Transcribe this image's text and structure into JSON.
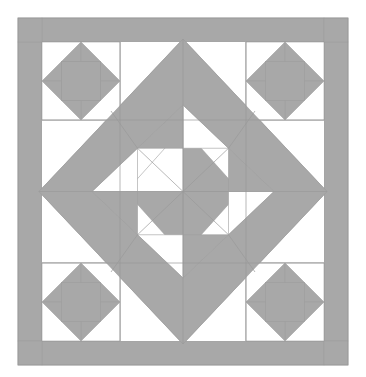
{
  "document": {
    "title": "Quilt Block Layout Diagram",
    "kind": "quilt-pattern-diagram",
    "canvas": {
      "width": 366,
      "height": 377
    },
    "background_color": "#ffffff"
  },
  "palette": {
    "background": "#ffffff",
    "fabric_light": "#ffffff",
    "fabric_medium_gray": "#a8a8a8",
    "seam_line": "#9a9a9a",
    "outer_margin": "#ffffff"
  },
  "layout": {
    "margin": {
      "left": 18,
      "top": 18,
      "right": 18,
      "bottom": 12
    },
    "border_width": 24,
    "block_left": 18,
    "block_top": 18,
    "block_right": 348,
    "block_bottom": 365,
    "inner_left": 42,
    "inner_top": 42,
    "inner_right": 324,
    "inner_bottom": 341,
    "grid_divisions": 4,
    "center_x": 183,
    "center_y": 191.5
  },
  "components": {
    "outer_border": {
      "name": "sashing-border",
      "color": "#a8a8a8",
      "width": 24,
      "corner_squares": 4
    },
    "center_medallion": {
      "name": "on-point-diamond-frame",
      "shape": "diamond",
      "color": "#a8a8a8",
      "outer_half_diagonal": 141,
      "inner_half_diagonal": 93
    },
    "corner_stars": {
      "name": "friendship-star-pinwheel",
      "count": 4,
      "size": 78,
      "positions": [
        "top-left",
        "top-right",
        "bottom-left",
        "bottom-right"
      ],
      "orientation": "identical",
      "center_square_color": "#a8a8a8",
      "blade_color": "#a8a8a8"
    },
    "center_pinwheel": {
      "name": "central-pinwheel",
      "color": "#a8a8a8",
      "half_size": 93
    }
  },
  "chart_data": {
    "type": "diagram",
    "symmetry": "4-fold rotational",
    "colors_used": [
      "#ffffff",
      "#a8a8a8"
    ],
    "element_counts": {
      "border_strips": 4,
      "border_corner_squares": 4,
      "star_blocks": 4,
      "star_blades_each": 4,
      "diamond_frame": 1,
      "center_pinwheel_blades": 4
    }
  }
}
